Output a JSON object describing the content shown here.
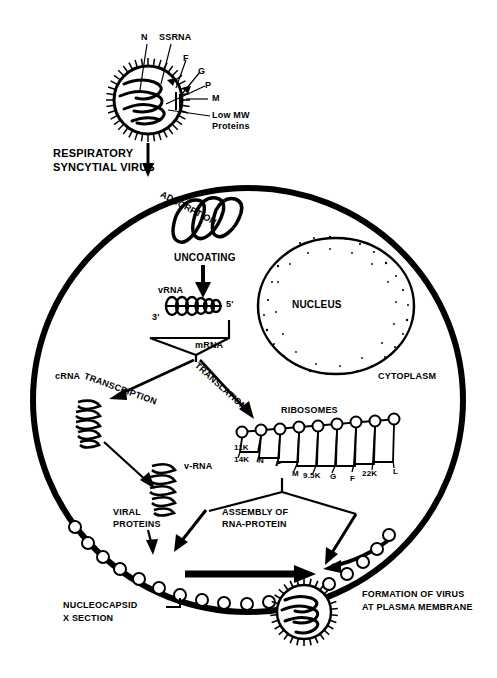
{
  "figure": {
    "ink_color": "#000000",
    "background_color": "#ffffff"
  },
  "virion": {
    "caption_line1": "RESPIRATORY",
    "caption_line2": "SYNCYTIAL VIRUS",
    "components": [
      {
        "key": "n",
        "label": "N"
      },
      {
        "key": "ssrna",
        "label": "SSRNA"
      },
      {
        "key": "f",
        "label": "F"
      },
      {
        "key": "g",
        "label": "G"
      },
      {
        "key": "p",
        "label": "P"
      },
      {
        "key": "m",
        "label": "M"
      },
      {
        "key": "lowmw_1",
        "label": "Low MW"
      },
      {
        "key": "lowmw_2",
        "label": "Proteins"
      }
    ]
  },
  "steps": {
    "adsorption": "ADSORPTION",
    "uncoating": "UNCOATING",
    "transcription": "TRANSCRIPTION",
    "translation": "TRANSLATION",
    "assembly_line1": "ASSEMBLY OF",
    "assembly_line2": "RNA-PROTEIN"
  },
  "cell": {
    "nucleus_label": "NUCLEUS",
    "cytoplasm_label": "CYTOPLASM"
  },
  "rna": {
    "vrna_label": "vRNA",
    "three_prime": "3'",
    "five_prime": "5'",
    "mrna_label": "mRNA",
    "crna_label": "cRNA",
    "v_rna_label": "v-RNA"
  },
  "ribosomes": {
    "title": "RIBOSOMES",
    "products": [
      {
        "label": "11K"
      },
      {
        "label": "14K"
      },
      {
        "label": "N"
      },
      {
        "label": "P"
      },
      {
        "label": "M"
      },
      {
        "label": "9.5K"
      },
      {
        "label": "G"
      },
      {
        "label": "F"
      },
      {
        "label": "22K"
      },
      {
        "label": "L"
      }
    ]
  },
  "proteins": {
    "viral_line1": "VIRAL",
    "viral_line2": "PROTEINS"
  },
  "membrane": {
    "nucleocapsid_line1": "NUCLEOCAPSID",
    "nucleocapsid_line2": "X SECTION",
    "formation_line1": "FORMATION OF VIRUS",
    "formation_line2": "AT PLASMA MEMBRANE"
  }
}
